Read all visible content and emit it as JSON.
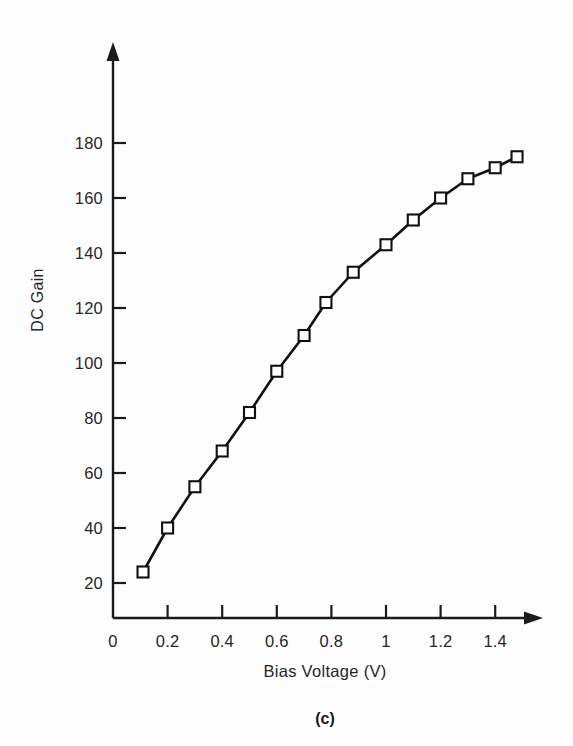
{
  "figure": {
    "panel_caption": "(c)",
    "background_color": "#fdfdfd",
    "ink_color": "#1a1a1a"
  },
  "chart_data": {
    "type": "line",
    "title": "",
    "xlabel": "Bias Voltage (V)",
    "ylabel": "DC Gain",
    "xlim": [
      0,
      1.565
    ],
    "ylim": [
      0,
      192
    ],
    "xticks": [
      0,
      0.2,
      0.4,
      0.6,
      0.8,
      1,
      1.2,
      1.4
    ],
    "xticklabels": [
      "0",
      "0.2",
      "0.4",
      "0.6",
      "0.8",
      "1",
      "1.2",
      "1.4"
    ],
    "yticks": [
      20,
      40,
      60,
      80,
      100,
      120,
      140,
      160,
      180
    ],
    "yticklabels": [
      "20",
      "40",
      "60",
      "80",
      "100",
      "120",
      "140",
      "160",
      "180"
    ],
    "grid": false,
    "legend": null,
    "marker": "open-square",
    "marker_size": 11,
    "line_color": "#111111",
    "line_width": 2.6,
    "x": [
      0.11,
      0.2,
      0.3,
      0.4,
      0.5,
      0.6,
      0.7,
      0.78,
      0.88,
      1.0,
      1.1,
      1.2,
      1.3,
      1.4,
      1.48
    ],
    "y": [
      24,
      40,
      55,
      68,
      82,
      97,
      110,
      122,
      133,
      143,
      152,
      160,
      167,
      171,
      175
    ],
    "series": [
      {
        "name": "DC Gain",
        "points": [
          {
            "x": 0.11,
            "y": 24
          },
          {
            "x": 0.2,
            "y": 40
          },
          {
            "x": 0.3,
            "y": 55
          },
          {
            "x": 0.4,
            "y": 68
          },
          {
            "x": 0.5,
            "y": 82
          },
          {
            "x": 0.6,
            "y": 97
          },
          {
            "x": 0.7,
            "y": 110
          },
          {
            "x": 0.78,
            "y": 122
          },
          {
            "x": 0.88,
            "y": 133
          },
          {
            "x": 1.0,
            "y": 143
          },
          {
            "x": 1.1,
            "y": 152
          },
          {
            "x": 1.2,
            "y": 160
          },
          {
            "x": 1.3,
            "y": 167
          },
          {
            "x": 1.4,
            "y": 171
          },
          {
            "x": 1.48,
            "y": 175
          }
        ]
      }
    ]
  }
}
